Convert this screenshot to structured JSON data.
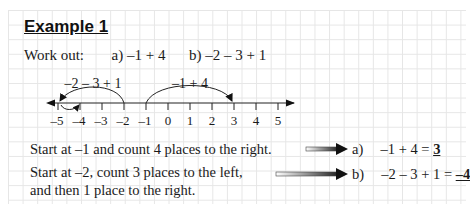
{
  "title": "Example 1",
  "prompt": {
    "label": "Work out:",
    "parts": [
      {
        "label": "a)",
        "expression": "–1 + 4"
      },
      {
        "label": "b)",
        "expression": "–2 – 3 + 1"
      }
    ]
  },
  "number_line": {
    "min": -5,
    "max": 5,
    "tick_labels": [
      "–5",
      "–4",
      "–3",
      "–2",
      "–1",
      "0",
      "1",
      "2",
      "3",
      "4",
      "5"
    ],
    "jumps": [
      {
        "label": "–2 – 3 + 1",
        "from": -2,
        "to": -5,
        "then_to": -4
      },
      {
        "label": "–1 + 4",
        "from": -1,
        "to": 3
      }
    ]
  },
  "explanations": [
    {
      "text_lines": [
        "Start at –1 and count 4 places to the right."
      ],
      "answer_label": "a)",
      "answer_expression": "–1 + 4 = ",
      "answer_result": "3"
    },
    {
      "text_lines": [
        "Start at –2, count 3 places to the left,",
        "and then 1 place to the right."
      ],
      "answer_label": "b)",
      "answer_expression": "–2 – 3 + 1 = ",
      "answer_result": "–4"
    }
  ]
}
